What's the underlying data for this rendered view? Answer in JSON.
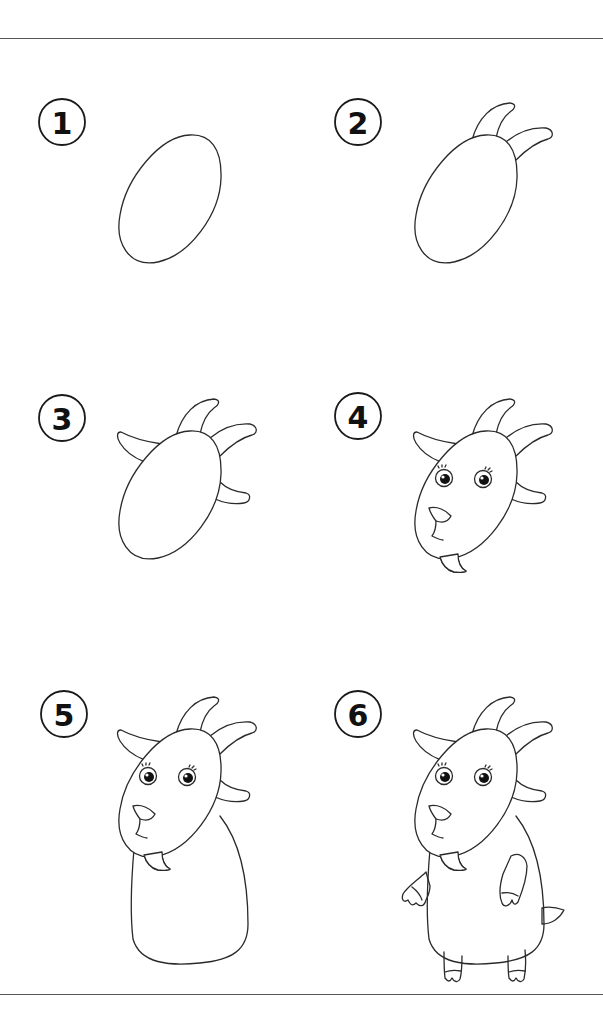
{
  "colors": {
    "line": "#2a2a2a",
    "rule": "#555555",
    "background": "#ffffff"
  },
  "steps": [
    {
      "number": "1",
      "description": "Head oval"
    },
    {
      "number": "2",
      "description": "Add two horns"
    },
    {
      "number": "3",
      "description": "Add ears"
    },
    {
      "number": "4",
      "description": "Add eyes, nose, mouth and beard"
    },
    {
      "number": "5",
      "description": "Add body"
    },
    {
      "number": "6",
      "description": "Add legs, arms and tail"
    }
  ]
}
